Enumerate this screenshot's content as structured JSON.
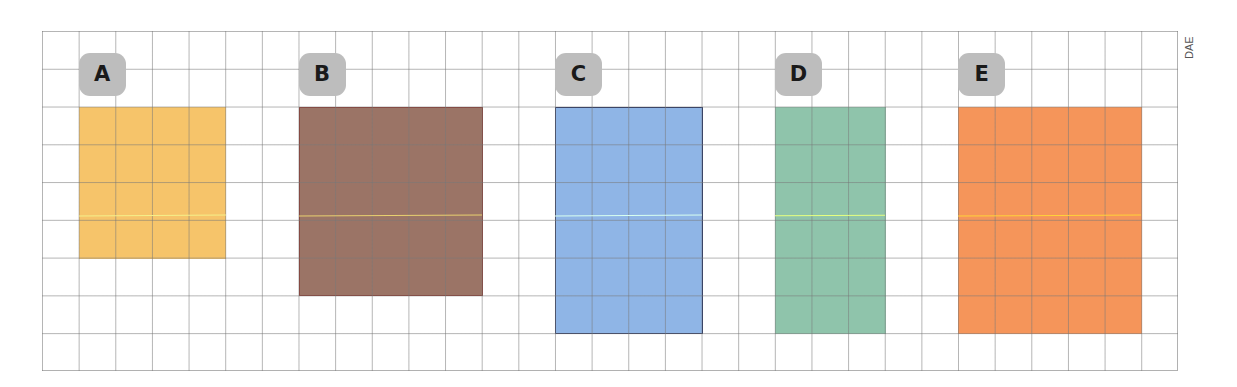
{
  "grid": {
    "columns": 31,
    "rows": 9,
    "cell_width_px": 36.645,
    "cell_height_px": 37.78,
    "line_color": "#8a8a8a"
  },
  "side_label": "DAE",
  "shapes": [
    {
      "label": "A",
      "col": 1,
      "row": 2,
      "cols": 4,
      "rows": 4,
      "fill": "#f6c46a",
      "border": "#f6c46a",
      "highlight": "#f5f08a"
    },
    {
      "label": "B",
      "col": 7,
      "row": 2,
      "cols": 5,
      "rows": 5,
      "fill": "#9b7466",
      "border": "#8a3a30",
      "highlight": "#e8d070"
    },
    {
      "label": "C",
      "col": 14,
      "row": 2,
      "cols": 4,
      "rows": 6,
      "fill": "#8fb5e6",
      "border": "#23305e",
      "highlight": "#d8fff0"
    },
    {
      "label": "D",
      "col": 20,
      "row": 2,
      "cols": 3,
      "rows": 6,
      "fill": "#8fc4ab",
      "border": "#8fc4ab",
      "highlight": "#e6ff80"
    },
    {
      "label": "E",
      "col": 25,
      "row": 2,
      "cols": 5,
      "rows": 6,
      "fill": "#f5955a",
      "border": "#f5955a",
      "highlight": "#ffd23a"
    }
  ]
}
